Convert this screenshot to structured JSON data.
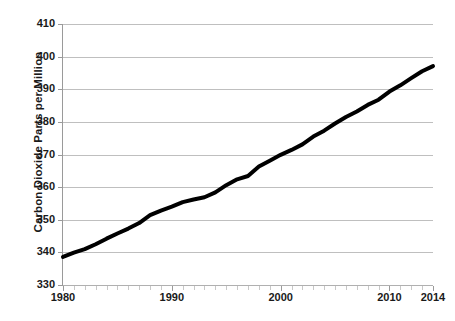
{
  "chart_data": {
    "type": "line",
    "title": "",
    "xlabel": "",
    "ylabel": "Carbon Dioxide Parts per Million",
    "xlim": [
      1980,
      2014
    ],
    "ylim": [
      330,
      410
    ],
    "grid": true,
    "legend": "none",
    "line_color": "#000000",
    "line_width_px": 4,
    "gridline_color": "#bfbfbf",
    "axis_color": "#9a9a9a",
    "y_ticks": [
      330,
      340,
      350,
      360,
      370,
      380,
      390,
      400,
      410
    ],
    "y_tick_labels": [
      "330",
      "340",
      "350",
      "360",
      "370",
      "380",
      "390",
      "400",
      "410"
    ],
    "x_ticks": [
      1980,
      1990,
      2000,
      2010,
      2014
    ],
    "x_tick_labels": [
      "1980",
      "1990",
      "2000",
      "2010",
      "2014"
    ],
    "x_minor_tick_interval": 1,
    "x": [
      1980,
      1981,
      1982,
      1983,
      1984,
      1985,
      1986,
      1987,
      1988,
      1989,
      1990,
      1991,
      1992,
      1993,
      1994,
      1995,
      1996,
      1997,
      1998,
      1999,
      2000,
      2001,
      2002,
      2003,
      2004,
      2005,
      2006,
      2007,
      2008,
      2009,
      2010,
      2011,
      2012,
      2013,
      2014
    ],
    "values": [
      338.6,
      339.9,
      341.0,
      342.5,
      344.2,
      345.8,
      347.3,
      349.0,
      351.4,
      352.8,
      354.0,
      355.4,
      356.2,
      356.9,
      358.4,
      360.6,
      362.4,
      363.4,
      366.3,
      368.1,
      369.9,
      371.4,
      373.1,
      375.5,
      377.3,
      379.5,
      381.5,
      383.2,
      385.2,
      386.8,
      389.3,
      391.2,
      393.4,
      395.5,
      397.1
    ],
    "annotations": []
  },
  "axis": {
    "y_title": "Carbon Dioxide Parts per Million"
  }
}
